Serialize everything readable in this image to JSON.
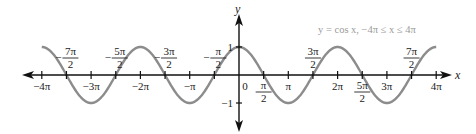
{
  "chart_data": {
    "type": "line",
    "title": "y = cos x, −4π ≤ x ≤ 4π",
    "xlabel": "x",
    "ylabel": "y",
    "function": "cos(x)",
    "xlim": [
      -12.566,
      12.566
    ],
    "ylim": [
      -1,
      1
    ],
    "grid": false,
    "legend": null,
    "series": [
      {
        "name": "y = cos x",
        "color": "#8c8c8c",
        "x": [
          "-4π",
          "-7π/2",
          "-3π",
          "-5π/2",
          "-2π",
          "-3π/2",
          "-π",
          "-π/2",
          "0",
          "π/2",
          "π",
          "3π/2",
          "2π",
          "5π/2",
          "3π",
          "7π/2",
          "4π"
        ],
        "values": [
          1,
          0,
          -1,
          0,
          1,
          0,
          -1,
          0,
          1,
          0,
          -1,
          0,
          1,
          0,
          -1,
          0,
          1
        ]
      }
    ],
    "x_ticks_below": [
      {
        "label": "−4π",
        "pos": -4
      },
      {
        "label": "−3π",
        "pos": -3
      },
      {
        "label": "−2π",
        "pos": -2
      },
      {
        "label": "−π",
        "pos": -1
      },
      {
        "label": "0",
        "pos": 0
      },
      {
        "label": "π",
        "pos": 1
      },
      {
        "label": "2π",
        "pos": 2
      },
      {
        "label": "3π",
        "pos": 3
      },
      {
        "label": "4π",
        "pos": 4
      }
    ],
    "x_ticks_fraction_above": [
      {
        "sign": "−",
        "num": "7π",
        "den": "2",
        "pos": -3.5
      },
      {
        "sign": "−",
        "num": "5π",
        "den": "2",
        "pos": -2.5
      },
      {
        "sign": "−",
        "num": "3π",
        "den": "2",
        "pos": -1.5
      },
      {
        "sign": "−",
        "num": "π",
        "den": "2",
        "pos": -0.5
      },
      {
        "sign": "",
        "num": "3π",
        "den": "2",
        "pos": 1.5
      },
      {
        "sign": "",
        "num": "7π",
        "den": "2",
        "pos": 3.5
      }
    ],
    "x_ticks_fraction_below": [
      {
        "sign": "",
        "num": "π",
        "den": "2",
        "pos": 0.5
      },
      {
        "sign": "",
        "num": "5π",
        "den": "2",
        "pos": 2.5
      }
    ],
    "y_ticks": [
      {
        "label": "1",
        "value": 1
      },
      {
        "label": "−1",
        "value": -1
      }
    ]
  }
}
